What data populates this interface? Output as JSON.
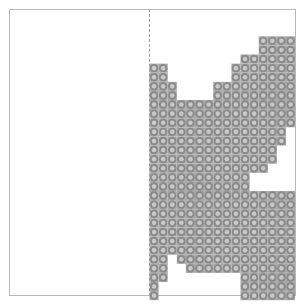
{
  "canvas": {
    "width": 305,
    "height": 305,
    "background": "#ffffff"
  },
  "border": {
    "label": "plot-border",
    "x": 9,
    "y": 9,
    "width": 287,
    "height": 287,
    "color": "#b9b9b9",
    "stroke_width": 1
  },
  "divider": {
    "label": "vertical-dashed-divider",
    "x": 149,
    "y_start": 9,
    "y_end": 296,
    "color": "#9a9a9a",
    "style": "dashed"
  },
  "grid": {
    "cell_size": 9.1,
    "origin_x": 149.5,
    "origin_y": 9.0,
    "columns": 16,
    "rows": 32,
    "dot_shape": "ring",
    "ring_color": "#8a8a8a",
    "ring_center_color": "#c9c9c9",
    "ring_outer_radius": 4.2,
    "ring_inner_radius": 2.3,
    "cell_fill": "#a8a8a8"
  },
  "chart_data": {
    "type": "heatmap",
    "title": "",
    "xlabel": "",
    "ylabel": "",
    "legend": [],
    "grid": true,
    "columns": 16,
    "rows": 32,
    "col_width": 9.1,
    "row_height": 9.1,
    "values": [
      [
        0,
        0,
        0,
        0,
        0,
        0,
        0,
        0,
        0,
        0,
        0,
        0,
        0,
        0,
        0,
        0
      ],
      [
        0,
        0,
        0,
        0,
        0,
        0,
        0,
        0,
        0,
        0,
        0,
        0,
        0,
        0,
        0,
        0
      ],
      [
        0,
        0,
        0,
        0,
        0,
        0,
        0,
        0,
        0,
        0,
        0,
        0,
        0,
        0,
        0,
        0
      ],
      [
        0,
        0,
        0,
        0,
        0,
        0,
        0,
        0,
        0,
        0,
        0,
        0,
        1,
        1,
        1,
        1
      ],
      [
        0,
        0,
        0,
        0,
        0,
        0,
        0,
        0,
        0,
        0,
        0,
        0,
        1,
        1,
        1,
        1
      ],
      [
        0,
        0,
        0,
        0,
        0,
        0,
        0,
        0,
        0,
        0,
        1,
        1,
        1,
        1,
        1,
        1
      ],
      [
        1,
        1,
        0,
        0,
        0,
        0,
        0,
        0,
        0,
        1,
        1,
        1,
        1,
        1,
        1,
        1
      ],
      [
        1,
        1,
        0,
        0,
        0,
        0,
        0,
        0,
        0,
        1,
        1,
        1,
        1,
        1,
        1,
        1
      ],
      [
        1,
        1,
        1,
        0,
        0,
        0,
        0,
        1,
        1,
        1,
        1,
        1,
        1,
        1,
        1,
        1
      ],
      [
        1,
        1,
        1,
        0,
        0,
        0,
        0,
        1,
        1,
        1,
        1,
        1,
        1,
        1,
        1,
        1
      ],
      [
        1,
        1,
        1,
        1,
        1,
        1,
        1,
        1,
        1,
        1,
        1,
        1,
        1,
        1,
        1,
        1
      ],
      [
        1,
        1,
        1,
        1,
        1,
        1,
        1,
        1,
        1,
        1,
        1,
        1,
        1,
        1,
        1,
        1
      ],
      [
        1,
        1,
        1,
        1,
        1,
        1,
        1,
        1,
        1,
        1,
        1,
        1,
        1,
        1,
        1,
        1
      ],
      [
        1,
        1,
        1,
        1,
        1,
        1,
        1,
        1,
        1,
        1,
        1,
        1,
        1,
        1,
        1,
        0
      ],
      [
        1,
        1,
        1,
        1,
        1,
        1,
        1,
        1,
        1,
        1,
        1,
        1,
        1,
        1,
        1,
        0
      ],
      [
        1,
        1,
        1,
        1,
        1,
        1,
        1,
        1,
        1,
        1,
        1,
        1,
        1,
        1,
        0,
        0
      ],
      [
        1,
        1,
        1,
        1,
        1,
        1,
        1,
        1,
        1,
        1,
        1,
        1,
        1,
        1,
        0,
        0
      ],
      [
        1,
        1,
        1,
        1,
        1,
        1,
        1,
        1,
        1,
        1,
        1,
        1,
        1,
        0,
        0,
        0
      ],
      [
        1,
        1,
        1,
        1,
        1,
        1,
        1,
        1,
        1,
        1,
        1,
        0,
        0,
        0,
        0,
        0
      ],
      [
        1,
        1,
        1,
        1,
        1,
        1,
        1,
        1,
        1,
        1,
        1,
        0,
        0,
        0,
        0,
        0
      ],
      [
        1,
        1,
        1,
        1,
        1,
        1,
        1,
        1,
        1,
        1,
        1,
        1,
        1,
        1,
        1,
        1
      ],
      [
        1,
        1,
        1,
        1,
        1,
        1,
        1,
        1,
        1,
        1,
        1,
        1,
        1,
        1,
        1,
        1
      ],
      [
        1,
        1,
        1,
        1,
        1,
        1,
        1,
        1,
        1,
        1,
        1,
        1,
        1,
        1,
        1,
        1
      ],
      [
        1,
        1,
        1,
        1,
        1,
        1,
        1,
        1,
        1,
        1,
        1,
        1,
        1,
        1,
        1,
        1
      ],
      [
        1,
        1,
        1,
        1,
        1,
        1,
        1,
        1,
        1,
        1,
        1,
        1,
        1,
        1,
        1,
        1
      ],
      [
        1,
        1,
        1,
        1,
        1,
        1,
        1,
        1,
        1,
        1,
        1,
        1,
        1,
        1,
        1,
        1
      ],
      [
        1,
        1,
        1,
        1,
        1,
        1,
        1,
        1,
        1,
        1,
        1,
        1,
        1,
        1,
        1,
        1
      ],
      [
        1,
        1,
        0,
        1,
        1,
        1,
        1,
        1,
        1,
        1,
        1,
        1,
        1,
        1,
        1,
        1
      ],
      [
        1,
        1,
        0,
        0,
        1,
        1,
        1,
        1,
        1,
        1,
        1,
        1,
        1,
        1,
        1,
        1
      ],
      [
        1,
        1,
        0,
        0,
        0,
        0,
        0,
        0,
        0,
        0,
        1,
        1,
        1,
        1,
        1,
        1
      ],
      [
        1,
        0,
        0,
        0,
        0,
        0,
        0,
        0,
        0,
        0,
        1,
        1,
        1,
        1,
        1,
        1
      ],
      [
        1,
        0,
        0,
        0,
        0,
        0,
        0,
        0,
        0,
        0,
        1,
        1,
        1,
        1,
        1,
        1
      ]
    ]
  }
}
